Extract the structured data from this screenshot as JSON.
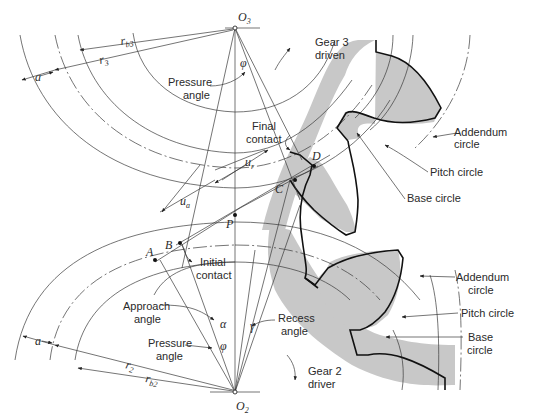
{
  "figure": {
    "type": "gear-mesh-geometry",
    "colors": {
      "gear_fill": "#c8c8c8",
      "line": "#3a3a3a",
      "tooth_outline": "#111111",
      "background": "#ffffff"
    }
  },
  "centers": {
    "gear3": "O",
    "gear3_sub": "3",
    "gear2": "O",
    "gear2_sub": "2"
  },
  "points": {
    "A": "A",
    "B": "B",
    "C": "C",
    "D": "D",
    "P": "P"
  },
  "gear3": {
    "title": "Gear 3",
    "role": "driven",
    "radius_base_label": "r",
    "radius_base_sub": "b3",
    "radius_pitch_label": "r",
    "radius_pitch_sub": "3",
    "addendum_label": "a",
    "pressure_angle_label": [
      "Pressure",
      "angle"
    ],
    "phi": "φ",
    "callouts": {
      "addendum": [
        "Addendum",
        "circle"
      ],
      "pitch": "Pitch circle",
      "base": "Base circle"
    }
  },
  "gear2": {
    "title": "Gear 2",
    "role": "driver",
    "radius_pitch_label": "r",
    "radius_pitch_sub": "2",
    "radius_base_label": "r",
    "radius_base_sub": "b2",
    "addendum_label": "a",
    "pressure_angle_label": [
      "Pressure",
      "angle"
    ],
    "phi": "φ",
    "callouts": {
      "addendum": [
        "Addendum",
        "circle"
      ],
      "pitch": "Pitch circle",
      "base": [
        "Base",
        "circle"
      ]
    }
  },
  "contact": {
    "final": [
      "Final",
      "contact"
    ],
    "initial": [
      "Initial",
      "contact"
    ],
    "u_r": "u",
    "u_r_sub": "r",
    "u_a": "u",
    "u_a_sub": "a"
  },
  "angles": {
    "approach": [
      "Approach",
      "angle"
    ],
    "alpha": "α",
    "recess": [
      "Recess",
      "angle"
    ],
    "gamma": "γ"
  }
}
